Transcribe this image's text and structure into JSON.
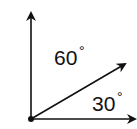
{
  "diagram": {
    "type": "angle-diagram",
    "labels": {
      "upper_angle": "60",
      "lower_angle": "30",
      "degree_symbol": "°"
    },
    "colors": {
      "stroke": "#111111",
      "background": "#ffffff"
    }
  }
}
